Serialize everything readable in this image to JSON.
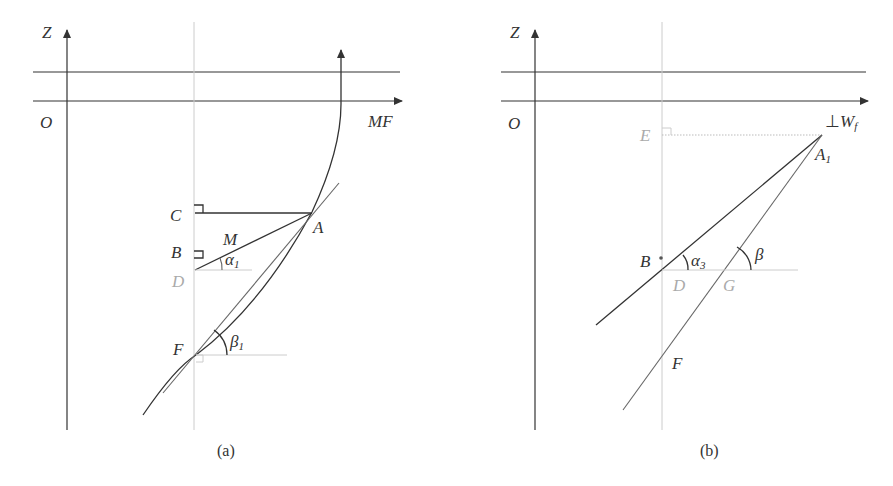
{
  "panel_a": {
    "caption": "(a)",
    "labels": {
      "z_axis": "Z",
      "origin": "O",
      "x_axis": "MF",
      "C": "C",
      "B": "B",
      "D": "D",
      "M": "M",
      "A": "A",
      "F": "F",
      "alpha": "α",
      "alpha_sub": "1",
      "beta": "β",
      "beta_sub": "1"
    }
  },
  "panel_b": {
    "caption": "(b)",
    "labels": {
      "z_axis": "Z",
      "origin": "O",
      "x_axis_perp": "⊥",
      "x_axis": "W",
      "x_axis_sub": "f",
      "E": "E",
      "A": "A",
      "A_sub": "1",
      "B": "B",
      "D": "D",
      "G": "G",
      "F": "F",
      "alpha": "α",
      "alpha_sub": "3",
      "beta": "β"
    }
  }
}
